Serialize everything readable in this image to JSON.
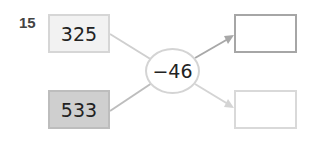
{
  "problem": {
    "number": "15",
    "inputs": [
      {
        "value": "325",
        "fill": "#f2f2f2"
      },
      {
        "value": "533",
        "fill": "#cfcfcf"
      }
    ],
    "operation": "−46",
    "outputs": [
      {
        "value": ""
      },
      {
        "value": ""
      }
    ]
  }
}
